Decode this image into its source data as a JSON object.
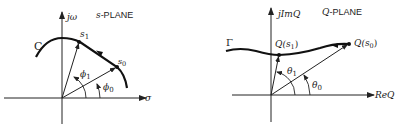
{
  "s_plane": {
    "title": "s-PLANE",
    "title_prefix": "s",
    "title_suffix": "-PLANE",
    "vertical_axis_label": "jω",
    "horizontal_axis_label": "σ",
    "contour_label": "C",
    "points": [
      {
        "name": "s1",
        "label": "s",
        "sub": "1"
      },
      {
        "name": "s0",
        "label": "s",
        "sub": "0"
      }
    ],
    "angles": [
      {
        "name": "phi1",
        "label": "ϕ",
        "sub": "1"
      },
      {
        "name": "phi0",
        "label": "ϕ",
        "sub": "0"
      }
    ]
  },
  "q_plane": {
    "title": "Q-PLANE",
    "title_prefix": "Q",
    "title_suffix": "-PLANE",
    "vertical_axis_label": "jImQ",
    "horizontal_axis_label": "ReQ",
    "contour_label": "Γ",
    "points": [
      {
        "name": "Qs1",
        "label": "Q(s",
        "sub": "1",
        "close": ")"
      },
      {
        "name": "Qs0",
        "label": "Q(s",
        "sub": "0",
        "close": ")"
      }
    ],
    "angles": [
      {
        "name": "theta1",
        "label": "θ",
        "sub": "1"
      },
      {
        "name": "theta0",
        "label": "θ",
        "sub": "0"
      }
    ]
  }
}
